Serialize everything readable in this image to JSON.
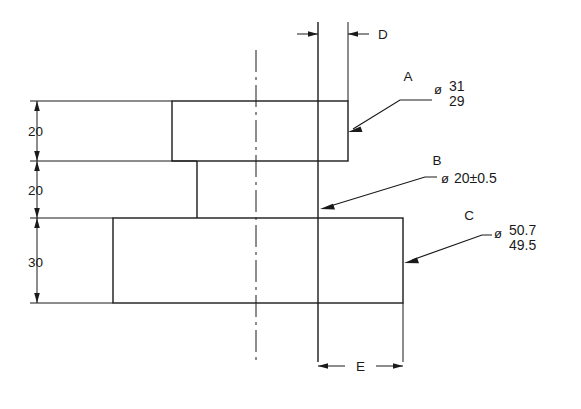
{
  "drawing": {
    "title": "Shaft stepped-diameter dimensioned drawing",
    "background_color": "#ffffff",
    "line_color": "#1a1a1a"
  },
  "vertical_dimensions": [
    {
      "name": "top-flange-height",
      "value": "20"
    },
    {
      "name": "shaft-length",
      "value": "20"
    },
    {
      "name": "bottom-flange-height",
      "value": "30"
    }
  ],
  "horizontal_dimensions": [
    {
      "name": "dimension-d",
      "value": "D"
    },
    {
      "name": "dimension-e",
      "value": "E"
    }
  ],
  "callouts": [
    {
      "id": "A",
      "letter": "A",
      "diameter_symbol": "ø",
      "upper": "31",
      "lower": "29",
      "type": "limits"
    },
    {
      "id": "B",
      "letter": "B",
      "diameter_symbol": "ø",
      "value": "20±0.5",
      "type": "plus-minus"
    },
    {
      "id": "C",
      "letter": "C",
      "diameter_symbol": "ø",
      "upper": "50.7",
      "lower": "49.5",
      "type": "limits"
    }
  ]
}
